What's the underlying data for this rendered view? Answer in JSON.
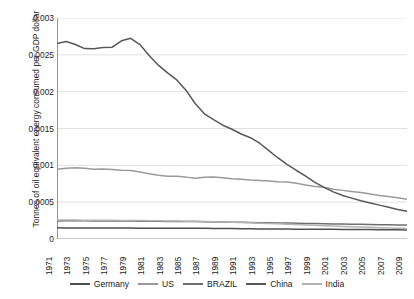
{
  "chart_data": {
    "type": "line",
    "title": "",
    "xlabel": "",
    "ylabel": "Tonnes of oil equivalent energy consumed per GDP dollar",
    "ylim": [
      0,
      0.003
    ],
    "yticks": [
      "0",
      "0.0005",
      "0.001",
      "0.0015",
      "0.002",
      "0.0025",
      "0.003"
    ],
    "ytick_values": [
      0,
      0.0005,
      0.001,
      0.0015,
      0.002,
      0.0025,
      0.003
    ],
    "grid": "horizontal",
    "legend_position": "bottom",
    "xlim": [
      1971,
      2009
    ],
    "x": [
      1971,
      1972,
      1973,
      1974,
      1975,
      1976,
      1977,
      1978,
      1979,
      1980,
      1981,
      1982,
      1983,
      1984,
      1985,
      1986,
      1987,
      1988,
      1989,
      1990,
      1991,
      1992,
      1993,
      1994,
      1995,
      1996,
      1997,
      1998,
      1999,
      2000,
      2001,
      2002,
      2003,
      2004,
      2005,
      2006,
      2007,
      2008,
      2009
    ],
    "xtick_labels": [
      "1971",
      "1973",
      "1975",
      "1977",
      "1979",
      "1981",
      "1983",
      "1985",
      "1987",
      "1989",
      "1991",
      "1993",
      "1995",
      "1997",
      "1999",
      "2001",
      "2003",
      "2005",
      "2007",
      "2009"
    ],
    "series": [
      {
        "name": "Germany",
        "color": "#4f4f4f",
        "values": [
          0.000152,
          0.000151,
          0.00015,
          0.00015,
          0.000149,
          0.000149,
          0.000148,
          0.000148,
          0.000148,
          0.000147,
          0.000147,
          0.000146,
          0.000146,
          0.000146,
          0.000146,
          0.000145,
          0.000145,
          0.000144,
          0.000143,
          0.000142,
          0.00014,
          0.000138,
          0.000137,
          0.000136,
          0.000135,
          0.000135,
          0.000134,
          0.000133,
          0.000132,
          0.000131,
          0.000131,
          0.00013,
          0.00013,
          0.000129,
          0.000128,
          0.000127,
          0.000125,
          0.000124,
          0.000123
        ]
      },
      {
        "name": "US",
        "color": "#9a9a9a",
        "values": [
          0.000948,
          0.000962,
          0.000968,
          0.00096,
          0.000947,
          0.000949,
          0.000943,
          0.000933,
          0.00093,
          0.00091,
          0.000885,
          0.000866,
          0.000852,
          0.000852,
          0.00084,
          0.000825,
          0.000838,
          0.000842,
          0.000832,
          0.000818,
          0.000812,
          0.000801,
          0.000795,
          0.000786,
          0.000776,
          0.000773,
          0.000757,
          0.000733,
          0.000713,
          0.000703,
          0.000676,
          0.00066,
          0.000645,
          0.00063,
          0.000611,
          0.000589,
          0.000576,
          0.000561,
          0.00054
        ]
      },
      {
        "name": "BRAZIL",
        "color": "#6e6e6e",
        "values": [
          0.000246,
          0.000247,
          0.000248,
          0.000247,
          0.000246,
          0.000245,
          0.000244,
          0.000243,
          0.000243,
          0.000242,
          0.000241,
          0.00024,
          0.000239,
          0.000238,
          0.000237,
          0.000236,
          0.000234,
          0.000232,
          0.00023,
          0.000228,
          0.000226,
          0.000224,
          0.000222,
          0.00022,
          0.000218,
          0.000216,
          0.000214,
          0.000212,
          0.00021,
          0.000208,
          0.000205,
          0.000203,
          0.000201,
          0.000199,
          0.000197,
          0.000195,
          0.000193,
          0.000191,
          0.000189
        ]
      },
      {
        "name": "China",
        "color": "#585858",
        "values": [
          0.002652,
          0.00268,
          0.00264,
          0.002585,
          0.002582,
          0.0026,
          0.002604,
          0.00269,
          0.002725,
          0.00264,
          0.00249,
          0.00236,
          0.002255,
          0.00216,
          0.00202,
          0.00184,
          0.0017,
          0.00162,
          0.001545,
          0.00149,
          0.001425,
          0.001375,
          0.0013,
          0.0012,
          0.0011,
          0.00101,
          0.00093,
          0.000855,
          0.00077,
          0.0007,
          0.00064,
          0.00059,
          0.000555,
          0.00052,
          0.00049,
          0.00046,
          0.00043,
          0.0004,
          0.000375
        ]
      },
      {
        "name": "India",
        "color": "#b2b2b2",
        "values": [
          0.000258,
          0.000258,
          0.000257,
          0.000256,
          0.000255,
          0.000254,
          0.000253,
          0.000252,
          0.000251,
          0.00025,
          0.000249,
          0.000248,
          0.000246,
          0.000244,
          0.000242,
          0.00024,
          0.000237,
          0.000234,
          0.000231,
          0.000228,
          0.000224,
          0.00022,
          0.000215,
          0.000211,
          0.000206,
          0.000201,
          0.000196,
          0.000191,
          0.000186,
          0.000181,
          0.000176,
          0.000171,
          0.000167,
          0.000162,
          0.000158,
          0.000154,
          0.00015,
          0.000146,
          0.000142
        ]
      }
    ]
  }
}
